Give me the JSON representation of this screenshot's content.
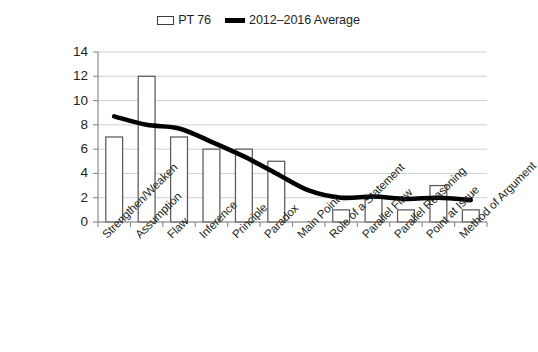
{
  "legend": {
    "entries": [
      {
        "label": "PT 76",
        "marker": "bar-swatch-icon",
        "color": "#ffffff",
        "outline": "#3b3b3b"
      },
      {
        "label": "2012–2016 Average",
        "marker": "line-swatch-icon",
        "color": "#000000"
      }
    ]
  },
  "axis": {
    "y_ticks": [
      "0",
      "2",
      "4",
      "6",
      "8",
      "10",
      "12",
      "14"
    ]
  },
  "chart_data": {
    "type": "bar",
    "title": "",
    "subtitle": "",
    "xlabel": "",
    "ylabel": "",
    "ylim": [
      0,
      14
    ],
    "ytick_step": 2,
    "grid": true,
    "legend_position": "top-center",
    "categories": [
      "Strengthen/Weaken",
      "Assumption",
      "Flaw",
      "Inference",
      "Principle",
      "Paradox",
      "Main Point",
      "Role of a Statement",
      "Parallel Flaw",
      "Parallel Reasoning",
      "Point at Issue",
      "Method of Argument"
    ],
    "series": [
      {
        "name": "PT 76",
        "type": "bar",
        "values": [
          7,
          12,
          7,
          6,
          6,
          5,
          0,
          1,
          2,
          1,
          3,
          1
        ]
      },
      {
        "name": "2012–2016 Average",
        "type": "line",
        "values": [
          8.7,
          8.0,
          7.7,
          6.6,
          5.4,
          4.0,
          2.6,
          2.0,
          2.1,
          1.9,
          2.0,
          1.8
        ]
      }
    ]
  }
}
